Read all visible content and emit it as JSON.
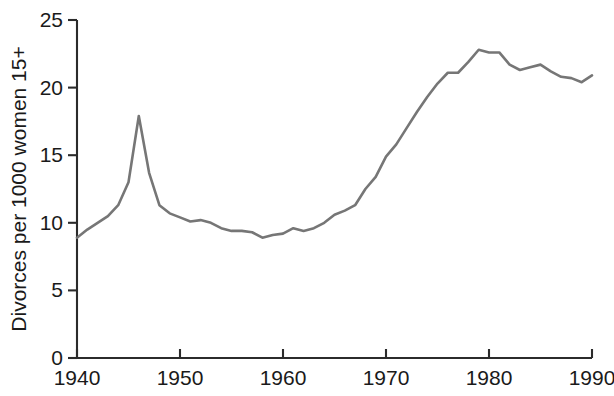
{
  "chart_data": {
    "type": "line",
    "title": "",
    "subtitle": "",
    "xlabel": "",
    "ylabel": "Divorces per 1000 women 15+",
    "xlim": [
      1940,
      1990
    ],
    "ylim": [
      0,
      25
    ],
    "grid": false,
    "legend": null,
    "line_color": "#767676",
    "axis_color": "#2b2b2b",
    "x_ticks": [
      1940,
      1950,
      1960,
      1970,
      1980,
      1990
    ],
    "x_tick_labels": [
      "1940",
      "1950",
      "1960",
      "1970",
      "1980",
      "1990"
    ],
    "y_ticks": [
      0,
      5,
      10,
      15,
      20,
      25
    ],
    "y_tick_labels": [
      "0",
      "5",
      "10",
      "15",
      "20",
      "25"
    ],
    "series": [
      {
        "name": "Divorces per 1000 women 15+",
        "x": [
          1940,
          1941,
          1942,
          1943,
          1944,
          1945,
          1946,
          1947,
          1948,
          1949,
          1950,
          1951,
          1952,
          1953,
          1954,
          1955,
          1956,
          1957,
          1958,
          1959,
          1960,
          1961,
          1962,
          1963,
          1964,
          1965,
          1966,
          1967,
          1968,
          1969,
          1970,
          1971,
          1972,
          1973,
          1974,
          1975,
          1976,
          1977,
          1978,
          1979,
          1980,
          1981,
          1982,
          1983,
          1984,
          1985,
          1986,
          1987,
          1988,
          1989,
          1990
        ],
        "values": [
          8.9,
          9.5,
          10.0,
          10.5,
          11.3,
          13.0,
          17.9,
          13.7,
          11.3,
          10.7,
          10.4,
          10.1,
          10.2,
          10.0,
          9.6,
          9.4,
          9.4,
          9.3,
          8.9,
          9.1,
          9.2,
          9.6,
          9.4,
          9.6,
          10.0,
          10.6,
          10.9,
          11.3,
          12.5,
          13.4,
          14.9,
          15.8,
          17.0,
          18.2,
          19.3,
          20.3,
          21.1,
          21.1,
          21.9,
          22.8,
          22.6,
          22.6,
          21.7,
          21.3,
          21.5,
          21.7,
          21.2,
          20.8,
          20.7,
          20.4,
          20.9
        ]
      }
    ]
  },
  "axes": {
    "y_axis_title": "Divorces per 1000 women 15+"
  }
}
